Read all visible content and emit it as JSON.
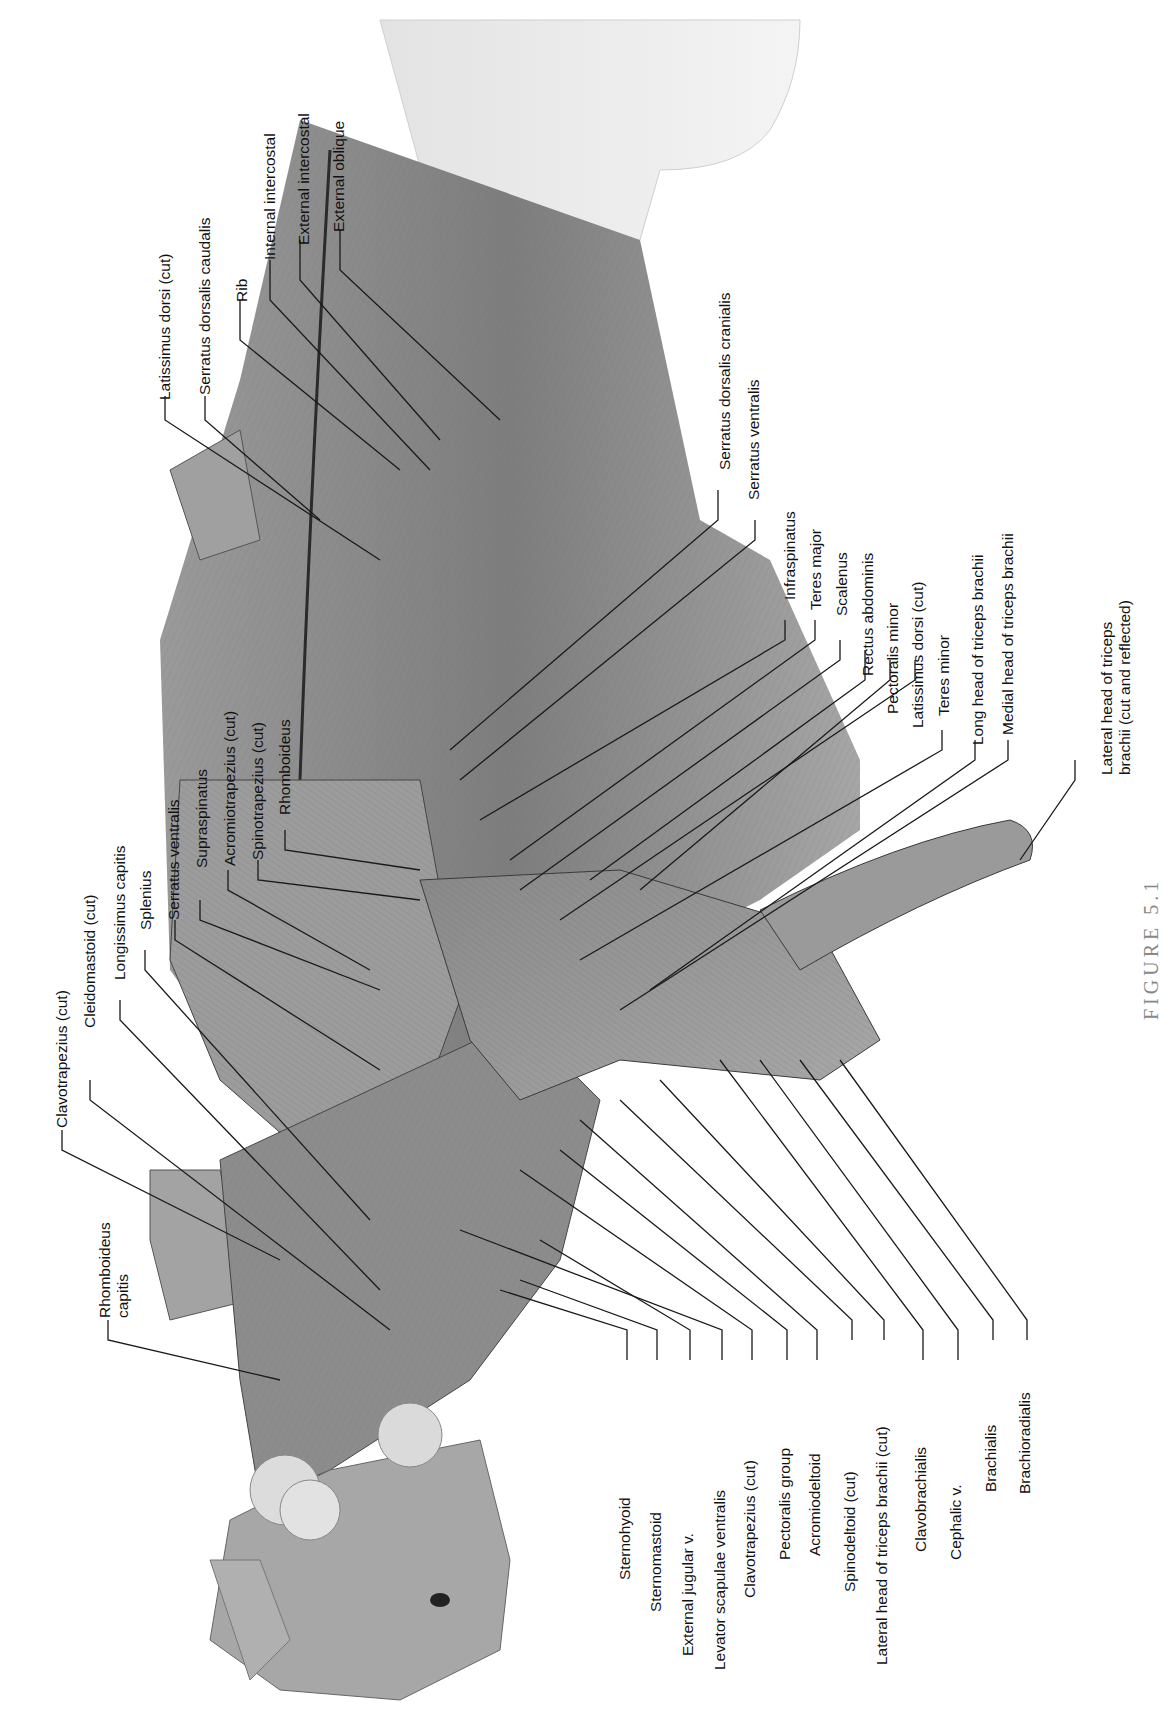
{
  "figure": {
    "orientation": "rotated 90 degrees counter-clockwise",
    "caption_partial": "FIGURE 5.1"
  },
  "labels": {
    "top_group": [
      {
        "id": "latissimus-dorsi-cut-top",
        "text": "Latissimus dorsi (cut)"
      },
      {
        "id": "serratus-dorsalis-caudalis",
        "text": "Serratus dorsalis caudalis"
      },
      {
        "id": "rib",
        "text": "Rib"
      },
      {
        "id": "internal-intercostal",
        "text": "Internal intercostal"
      },
      {
        "id": "external-intercostal",
        "text": "External intercostal"
      },
      {
        "id": "external-oblique",
        "text": "External oblique"
      }
    ],
    "left_group": [
      {
        "id": "clavotrapezius-cut-left",
        "text": "Clavotrapezius (cut)"
      },
      {
        "id": "cleidomastoid-cut",
        "text": "Cleidomastoid (cut)"
      },
      {
        "id": "longissimus-capitis",
        "text": "Longissimus capitis"
      },
      {
        "id": "splenius",
        "text": "Splenius"
      },
      {
        "id": "serratus-ventralis-left",
        "text": "Serratus ventralis"
      },
      {
        "id": "supraspinatus",
        "text": "Supraspinatus"
      },
      {
        "id": "acromiotrapezius-cut",
        "text": "Acromiotrapezius (cut)"
      },
      {
        "id": "spinotrapezius-cut",
        "text": "Spinotrapezius (cut)"
      },
      {
        "id": "rhomboideus",
        "text": "Rhomboideus"
      },
      {
        "id": "rhomboideus-capitis",
        "text": "Rhomboideus capitis",
        "line1": "Rhomboideus",
        "line2": "capitis"
      }
    ],
    "right_upper_group": [
      {
        "id": "serratus-dorsalis-cranialis",
        "text": "Serratus dorsalis cranialis"
      },
      {
        "id": "serratus-ventralis-right",
        "text": "Serratus ventralis"
      },
      {
        "id": "infraspinatus",
        "text": "Infraspinatus"
      },
      {
        "id": "teres-major",
        "text": "Teres major"
      },
      {
        "id": "scalenus",
        "text": "Scalenus"
      },
      {
        "id": "rectus-abdominis",
        "text": "Rectus abdominis"
      },
      {
        "id": "pectoralis-minor",
        "text": "Pectoralis minor"
      },
      {
        "id": "latissimus-dorsi-cut-right",
        "text": "Latissimus dorsi (cut)"
      },
      {
        "id": "teres-minor",
        "text": "Teres minor"
      },
      {
        "id": "long-head-triceps",
        "text": "Long head of triceps brachii"
      },
      {
        "id": "medial-head-triceps",
        "text": "Medial head of triceps brachii"
      },
      {
        "id": "lateral-head-triceps-reflected",
        "text": "Lateral head of triceps brachii (cut and reflected)",
        "line1": "Lateral head of triceps",
        "line2": "brachii (cut and reflected)"
      }
    ],
    "bottom_group": [
      {
        "id": "sternohyoid",
        "text": "Sternohyoid"
      },
      {
        "id": "sternomastoid",
        "text": "Sternomastoid"
      },
      {
        "id": "external-jugular-v",
        "text": "External jugular v."
      },
      {
        "id": "levator-scapulae-ventralis",
        "text": "Levator scapulae ventralis"
      },
      {
        "id": "clavotrapezius-cut-bottom",
        "text": "Clavotrapezius (cut)"
      },
      {
        "id": "pectoralis-group",
        "text": "Pectoralis group"
      },
      {
        "id": "acromiodeltoid",
        "text": "Acromiodeltoid"
      },
      {
        "id": "spinodeltoid-cut",
        "text": "Spinodeltoid (cut)"
      },
      {
        "id": "lateral-head-triceps-cut",
        "text": "Lateral head of triceps brachii (cut)"
      },
      {
        "id": "clavobrachialis",
        "text": "Clavobrachialis"
      },
      {
        "id": "cephalic-v",
        "text": "Cephalic v."
      },
      {
        "id": "brachialis",
        "text": "Brachialis"
      },
      {
        "id": "brachioradialis",
        "text": "Brachioradialis"
      }
    ]
  },
  "colors": {
    "background": "#ffffff",
    "label_text": "#111111",
    "leader_line": "#1a1a1a",
    "muscle_light": "#b8b8b8",
    "muscle_mid": "#8e8e8e",
    "muscle_dark": "#5a5a5a",
    "gland": "#d9d9d9",
    "caption": "#888888"
  }
}
